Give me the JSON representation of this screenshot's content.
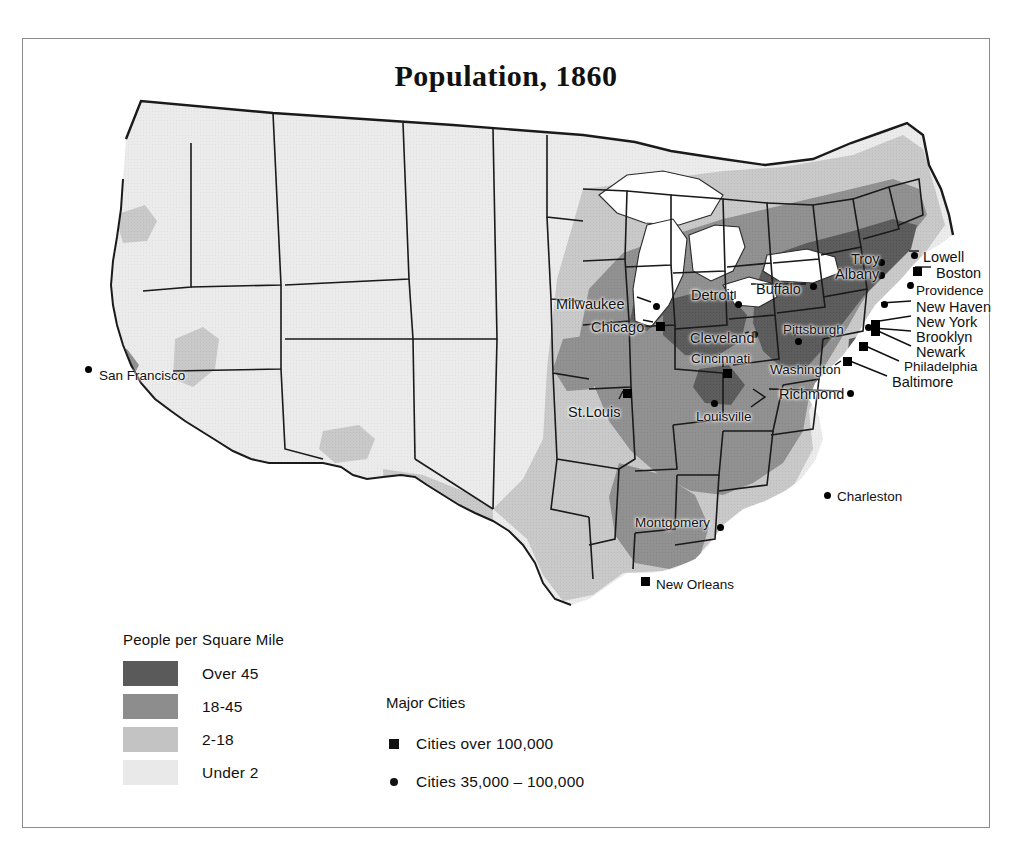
{
  "page": {
    "header_fragment": "",
    "title": "Population, 1860"
  },
  "legend_density": {
    "title": "People per Square Mile",
    "classes": [
      {
        "label": "Over 45",
        "color": "#5a5a5a"
      },
      {
        "label": "18-45",
        "color": "#8d8d8d"
      },
      {
        "label": "2-18",
        "color": "#c3c3c3"
      },
      {
        "label": "Under 2",
        "color": "#e9e9e9"
      }
    ]
  },
  "legend_cities": {
    "title": "Major Cities",
    "entries": [
      {
        "label": "Cities over 100,000",
        "marker": "square"
      },
      {
        "label": "Cities 35,000 – 100,000",
        "marker": "dot"
      }
    ]
  },
  "map": {
    "water_color": "#ffffff",
    "border_color": "#111111",
    "cities": [
      {
        "name": "San Francisco",
        "label": "San Francisco",
        "marker": "dot",
        "label_x": 76,
        "label_y": 330,
        "mark_x": 62,
        "mark_y": 327
      },
      {
        "name": "Milwaukee",
        "label": "Milwaukee",
        "marker": "dot",
        "label_x": 533,
        "label_y": 258,
        "mark_x": 630,
        "mark_y": 264
      },
      {
        "name": "Chicago",
        "label": "Chicago",
        "marker": "square",
        "label_x": 568,
        "label_y": 281,
        "mark_x": 633,
        "mark_y": 283
      },
      {
        "name": "Detroit",
        "label": "Detroit",
        "marker": "dot",
        "label_x": 668,
        "label_y": 249,
        "mark_x": 712,
        "mark_y": 262
      },
      {
        "name": "Buffalo",
        "label": "Buffalo",
        "marker": "dot",
        "label_x": 733,
        "label_y": 243,
        "mark_x": 787,
        "mark_y": 244
      },
      {
        "name": "Cleveland",
        "label": "Cleveland",
        "marker": "dot",
        "label_x": 667,
        "label_y": 292,
        "mark_x": 728,
        "mark_y": 292
      },
      {
        "name": "Cincinnati",
        "label": "Cincinnati",
        "marker": "square",
        "label_x": 668,
        "label_y": 313,
        "mark_x": 700,
        "mark_y": 330
      },
      {
        "name": "Pittsburgh",
        "label": "Pittsburgh",
        "marker": "dot",
        "label_x": 760,
        "label_y": 284,
        "mark_x": 772,
        "mark_y": 299
      },
      {
        "name": "St. Louis",
        "label": "St.Louis",
        "marker": "square",
        "label_x": 545,
        "label_y": 366,
        "mark_x": 600,
        "mark_y": 350
      },
      {
        "name": "Louisville",
        "label": "Louisville",
        "marker": "dot",
        "label_x": 673,
        "label_y": 371,
        "mark_x": 688,
        "mark_y": 361
      },
      {
        "name": "Richmond",
        "label": "Richmond",
        "marker": "dot",
        "label_x": 756,
        "label_y": 348,
        "mark_x": 824,
        "mark_y": 351
      },
      {
        "name": "Washington",
        "label": "Washington",
        "marker": "dot",
        "label_x": 747,
        "label_y": 324,
        "mark_x": 820,
        "mark_y": 320
      },
      {
        "name": "Troy",
        "label": "Troy",
        "marker": "dot",
        "label_x": 828,
        "label_y": 213,
        "mark_x": 855,
        "mark_y": 220
      },
      {
        "name": "Albany",
        "label": "Albany",
        "marker": "dot",
        "label_x": 812,
        "label_y": 228,
        "mark_x": 855,
        "mark_y": 233
      },
      {
        "name": "Lowell",
        "label": "Lowell",
        "marker": "dot",
        "label_x": 900,
        "label_y": 211,
        "mark_x": 888,
        "mark_y": 213
      },
      {
        "name": "Boston",
        "label": "Boston",
        "marker": "square",
        "label_x": 913,
        "label_y": 227,
        "mark_x": 890,
        "mark_y": 228
      },
      {
        "name": "Providence",
        "label": "Providence",
        "marker": "dot",
        "label_x": 893,
        "label_y": 245,
        "mark_x": 884,
        "mark_y": 243
      },
      {
        "name": "New Haven",
        "label": "New Haven",
        "marker": "dot",
        "label_x": 893,
        "label_y": 261,
        "mark_x": 858,
        "mark_y": 262
      },
      {
        "name": "New York",
        "label": "New York",
        "marker": "square",
        "label_x": 893,
        "label_y": 276,
        "mark_x": 848,
        "mark_y": 281
      },
      {
        "name": "Brooklyn",
        "label": "Brooklyn",
        "marker": "square",
        "label_x": 893,
        "label_y": 291,
        "mark_x": 848,
        "mark_y": 288
      },
      {
        "name": "Newark",
        "label": "Newark",
        "marker": "dot",
        "label_x": 893,
        "label_y": 306,
        "mark_x": 842,
        "mark_y": 285
      },
      {
        "name": "Philadelphia",
        "label": "Philadelphia",
        "marker": "square",
        "label_x": 881,
        "label_y": 321,
        "mark_x": 836,
        "mark_y": 303
      },
      {
        "name": "Baltimore",
        "label": "Baltimore",
        "marker": "square",
        "label_x": 869,
        "label_y": 336,
        "mark_x": 820,
        "mark_y": 318
      },
      {
        "name": "Charleston",
        "label": "Charleston",
        "marker": "dot",
        "label_x": 814,
        "label_y": 451,
        "mark_x": 801,
        "mark_y": 453
      },
      {
        "name": "Montgomery",
        "label": "Montgomery",
        "marker": "dot",
        "label_x": 612,
        "label_y": 477,
        "mark_x": 694,
        "mark_y": 485
      },
      {
        "name": "New Orleans",
        "label": "New Orleans",
        "marker": "square",
        "label_x": 633,
        "label_y": 539,
        "mark_x": 618,
        "mark_y": 538
      }
    ]
  }
}
